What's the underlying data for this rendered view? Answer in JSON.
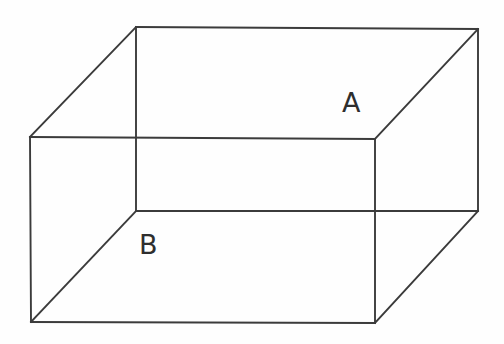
{
  "figure": {
    "type": "3d-solid-wireframe",
    "shape_name": "rectangular prism (cuboid)",
    "canvas": {
      "width": 504,
      "height": 344,
      "background": "#ffffff"
    },
    "stroke": {
      "color": "#3b3b3b",
      "width": 1.9
    },
    "labels": [
      {
        "id": "A",
        "text": "A",
        "x": 342,
        "y": 89,
        "refers_to": "upper-right region near back-right top corner"
      },
      {
        "id": "B",
        "text": "B",
        "x": 139,
        "y": 231,
        "refers_to": "lower-left region near inner front-left bottom corner"
      }
    ],
    "vertices": {
      "front_top_left": [
        30,
        137
      ],
      "front_top_right": [
        375,
        139
      ],
      "front_bottom_right": [
        375,
        323
      ],
      "front_bottom_left": [
        31,
        322
      ],
      "back_top_left": [
        136,
        27
      ],
      "back_top_right": [
        478,
        29
      ],
      "back_bottom_right": [
        478,
        211
      ],
      "back_bottom_left": [
        136,
        211
      ]
    },
    "edges": [
      {
        "name": "front-face-top",
        "from": "front_top_left",
        "to": "front_top_right"
      },
      {
        "name": "front-face-right",
        "from": "front_top_right",
        "to": "front_bottom_right"
      },
      {
        "name": "front-face-bottom",
        "from": "front_bottom_right",
        "to": "front_bottom_left"
      },
      {
        "name": "front-face-left",
        "from": "front_bottom_left",
        "to": "front_top_left"
      },
      {
        "name": "back-face-top",
        "from": "back_top_left",
        "to": "back_top_right"
      },
      {
        "name": "back-face-right",
        "from": "back_top_right",
        "to": "back_bottom_right"
      },
      {
        "name": "back-face-bottom",
        "from": "back_bottom_right",
        "to": "back_bottom_left"
      },
      {
        "name": "back-face-left",
        "from": "back_bottom_left",
        "to": "back_top_left"
      },
      {
        "name": "connector-top-left",
        "from": "front_top_left",
        "to": "back_top_left"
      },
      {
        "name": "connector-top-right",
        "from": "front_top_right",
        "to": "back_top_right"
      },
      {
        "name": "connector-bottom-right",
        "from": "front_bottom_right",
        "to": "back_bottom_right"
      },
      {
        "name": "connector-bottom-left",
        "from": "front_bottom_left",
        "to": "back_bottom_left"
      }
    ]
  }
}
